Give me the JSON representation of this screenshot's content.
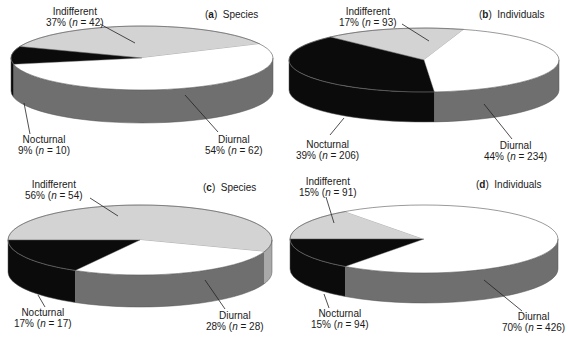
{
  "colors": {
    "indifferent_top": "#d3d3d3",
    "indifferent_side": "#a9a9a9",
    "nocturnal_top": "#0b0b0b",
    "nocturnal_side": "#0b0b0b",
    "diurnal_top": "#ffffff",
    "diurnal_side": "#6f6f6f",
    "outline": "#555555"
  },
  "chart_data": [
    {
      "type": "pie",
      "panel": "a",
      "title": "Species",
      "categories": [
        "Indifferent",
        "Nocturnal",
        "Diurnal"
      ],
      "values": [
        37,
        9,
        54
      ],
      "n": [
        42,
        10,
        62
      ],
      "labels": [
        "37% (n = 42)",
        "9% (n = 10)",
        "54% (n = 62)"
      ],
      "style": "3d-pie"
    },
    {
      "type": "pie",
      "panel": "b",
      "title": "Individuals",
      "categories": [
        "Indifferent",
        "Nocturnal",
        "Diurnal"
      ],
      "values": [
        17,
        39,
        44
      ],
      "n": [
        93,
        206,
        234
      ],
      "labels": [
        "17% (n = 93)",
        "39% (n = 206)",
        "44% (n = 234)"
      ],
      "style": "3d-pie"
    },
    {
      "type": "pie",
      "panel": "c",
      "title": "Species",
      "categories": [
        "Indifferent",
        "Nocturnal",
        "Diurnal"
      ],
      "values": [
        56,
        17,
        28
      ],
      "n": [
        54,
        17,
        28
      ],
      "labels": [
        "56% (n = 54)",
        "17% (n = 17)",
        "28% (n = 28)"
      ],
      "style": "3d-pie"
    },
    {
      "type": "pie",
      "panel": "d",
      "title": "Individuals",
      "categories": [
        "Indifferent",
        "Nocturnal",
        "Diurnal"
      ],
      "values": [
        15,
        15,
        70
      ],
      "n": [
        91,
        94,
        426
      ],
      "labels": [
        "15% (n = 91)",
        "15% (n = 94)",
        "70% (n = 426)"
      ],
      "style": "3d-pie"
    }
  ],
  "panels": [
    {
      "letter": "a",
      "title": "Species",
      "indifferent": {
        "name": "Indifferent",
        "pct": "37%",
        "n": "42"
      },
      "nocturnal": {
        "name": "Nocturnal",
        "pct": "9%",
        "n": "10"
      },
      "diurnal": {
        "name": "Diurnal",
        "pct": "54%",
        "n": "62"
      }
    },
    {
      "letter": "b",
      "title": "Individuals",
      "indifferent": {
        "name": "Indifferent",
        "pct": "17%",
        "n": "93"
      },
      "nocturnal": {
        "name": "Nocturnal",
        "pct": "39%",
        "n": "206"
      },
      "diurnal": {
        "name": "Diurnal",
        "pct": "44%",
        "n": "234"
      }
    },
    {
      "letter": "c",
      "title": "Species",
      "indifferent": {
        "name": "Indifferent",
        "pct": "56%",
        "n": "54"
      },
      "nocturnal": {
        "name": "Nocturnal",
        "pct": "17%",
        "n": "17"
      },
      "diurnal": {
        "name": "Diurnal",
        "pct": "28%",
        "n": "28"
      }
    },
    {
      "letter": "d",
      "title": "Individuals",
      "indifferent": {
        "name": "Indifferent",
        "pct": "15%",
        "n": "91"
      },
      "nocturnal": {
        "name": "Nocturnal",
        "pct": "15%",
        "n": "94"
      },
      "diurnal": {
        "name": "Diurnal",
        "pct": "70%",
        "n": "426"
      }
    }
  ],
  "n_symbol": "n",
  "open_paren": "(",
  "equals": " = ",
  "close_paren": ")"
}
